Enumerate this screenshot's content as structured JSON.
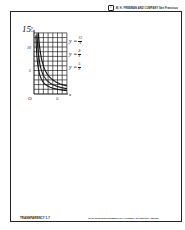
{
  "header": {
    "copyright_symbol": "©",
    "text": "W. H. FREEMAN AND COMPANY   San Francisco"
  },
  "footer": {
    "left": "TRANSPARENCY 1-7",
    "right": "To be used with ELEMENTARY ALGEBRA by Harold R. Jacobs"
  },
  "problem_number": "15.",
  "equations": [
    {
      "lhs": "y =",
      "numerator": "12",
      "denominator": "x"
    },
    {
      "lhs": "y =",
      "numerator": "8",
      "denominator": "x"
    },
    {
      "lhs": "y =",
      "numerator": "5",
      "denominator": "x"
    }
  ],
  "chart_data": {
    "type": "line",
    "title": "",
    "xlabel": "x",
    "ylabel": "y",
    "xlim": [
      0,
      7
    ],
    "ylim": [
      0,
      13
    ],
    "grid": true,
    "x_ticks": [
      {
        "value": 0,
        "label": "O"
      },
      {
        "value": 5,
        "label": "5"
      }
    ],
    "y_ticks": [
      {
        "value": 5,
        "label": "5"
      },
      {
        "value": 10,
        "label": "10"
      }
    ],
    "series": [
      {
        "name": "y = 12/x",
        "k": 12,
        "x_range": [
          0.92,
          7
        ]
      },
      {
        "name": "y = 8/x",
        "k": 8,
        "x_range": [
          0.62,
          7
        ]
      },
      {
        "name": "y = 5/x",
        "k": 5,
        "x_range": [
          0.4,
          7
        ]
      }
    ]
  }
}
